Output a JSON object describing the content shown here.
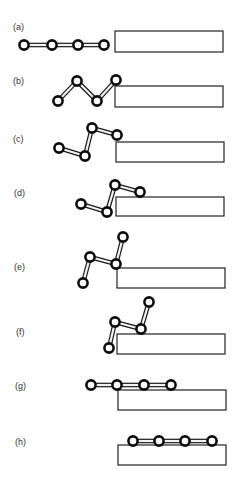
{
  "figure": {
    "panels": [
      {
        "label": "(a)",
        "label_pos": [
          13,
          30
        ],
        "surface": {
          "x": 115,
          "y": 31,
          "w": 108,
          "h": 21
        },
        "joints": [
          [
            24,
            45
          ],
          [
            52,
            45
          ],
          [
            78,
            45
          ],
          [
            104,
            45
          ]
        ]
      },
      {
        "label": "(b)",
        "label_pos": [
          13,
          84
        ],
        "surface": {
          "x": 115,
          "y": 86,
          "w": 108,
          "h": 21
        },
        "joints": [
          [
            58,
            101
          ],
          [
            77,
            81
          ],
          [
            97,
            101
          ],
          [
            116,
            80
          ]
        ]
      },
      {
        "label": "(c)",
        "label_pos": [
          13,
          142
        ],
        "surface": {
          "x": 116,
          "y": 142,
          "w": 108,
          "h": 20
        },
        "joints": [
          [
            59,
            148
          ],
          [
            85,
            156
          ],
          [
            92,
            128
          ],
          [
            117,
            135
          ]
        ]
      },
      {
        "label": "(d)",
        "label_pos": [
          14,
          196
        ],
        "surface": {
          "x": 116,
          "y": 197,
          "w": 108,
          "h": 19
        },
        "joints": [
          [
            81,
            204
          ],
          [
            107,
            212
          ],
          [
            115,
            185
          ],
          [
            140,
            192
          ]
        ]
      },
      {
        "label": "(e)",
        "label_pos": [
          14,
          270
        ],
        "surface": {
          "x": 117,
          "y": 268,
          "w": 108,
          "h": 20
        },
        "joints": [
          [
            83,
            283
          ],
          [
            90,
            257
          ],
          [
            116,
            264
          ],
          [
            123,
            237
          ]
        ]
      },
      {
        "label": "(f)",
        "label_pos": [
          16,
          335
        ],
        "surface": {
          "x": 117,
          "y": 334,
          "w": 108,
          "h": 20
        },
        "joints": [
          [
            109,
            348
          ],
          [
            115,
            322
          ],
          [
            141,
            329
          ],
          [
            149,
            302
          ]
        ]
      },
      {
        "label": "(g)",
        "label_pos": [
          15,
          389
        ],
        "surface": {
          "x": 118,
          "y": 390,
          "w": 108,
          "h": 20
        },
        "joints": [
          [
            91,
            385
          ],
          [
            117,
            385
          ],
          [
            144,
            385
          ],
          [
            171,
            385
          ]
        ]
      },
      {
        "label": "(h)",
        "label_pos": [
          15,
          445
        ],
        "surface": {
          "x": 118,
          "y": 445,
          "w": 108,
          "h": 20
        },
        "joints": [
          [
            133,
            441
          ],
          [
            159,
            441
          ],
          [
            185,
            441
          ],
          [
            212,
            441
          ]
        ]
      }
    ],
    "style": {
      "joint_radius": 4.6,
      "stroke_color": "#0d0d0d",
      "link_fill": "#f2f2f2",
      "surface_stroke": "#222222",
      "label_color": "#333333"
    }
  }
}
